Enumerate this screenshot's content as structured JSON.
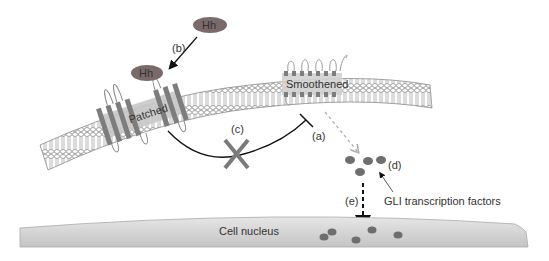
{
  "diagram": {
    "labels": {
      "hh_free": "Hh",
      "hh_bound": "Hh",
      "patched": "Patched",
      "smoothened": "Smoothened",
      "a": "(a)",
      "b": "(b)",
      "c": "(c)",
      "d": "(d)",
      "e": "(e)",
      "gli": "GLI transcription factors",
      "nucleus": "Cell nucleus"
    },
    "colors": {
      "hh_oval": "#7a6a6a",
      "receptor": "#7d7d7d",
      "receptor_bg": "#c8c8c8",
      "membrane": "#9a9a9a",
      "inhibition_x": "#7a7a7a",
      "gli_dot": "#6e6e6e",
      "nucleus_fill": "#cfcfcf",
      "line": "#111111"
    }
  }
}
